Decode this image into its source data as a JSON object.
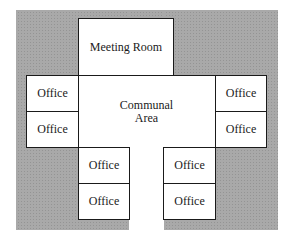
{
  "diagram": {
    "type": "floor-plan",
    "background_color": "#a9a9a9",
    "line_color": "#1a1a1a",
    "rooms": {
      "meeting_room": "Meeting Room",
      "communal_area": "Communal\nArea",
      "office_left_top": "Office",
      "office_left_bottom": "Office",
      "office_right_top": "Office",
      "office_right_bottom": "Office",
      "office_bottom_left_top": "Office",
      "office_bottom_left_bottom": "Office",
      "office_bottom_right_top": "Office",
      "office_bottom_right_bottom": "Office"
    }
  }
}
